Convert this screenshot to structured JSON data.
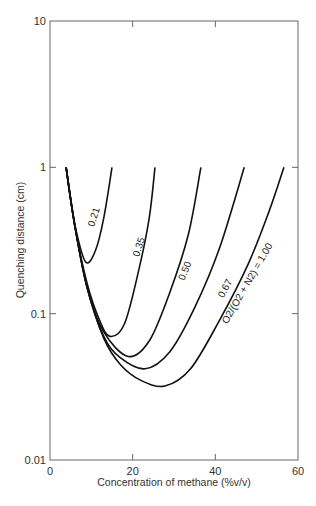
{
  "chart_data": {
    "type": "line",
    "title": "",
    "xlabel": "Concentration of methane (%v/v)",
    "ylabel": "Quenching distance (cm)",
    "xlim": [
      0,
      60
    ],
    "ylim": [
      0.01,
      10
    ],
    "yscale": "log",
    "grid": false,
    "x_ticks": [
      "0",
      "20",
      "40",
      "60"
    ],
    "y_ticks": [
      "0.01",
      "0.1",
      "1",
      "10"
    ],
    "legend": "inline curve labels",
    "series": [
      {
        "name": "0.21",
        "label": "0.21",
        "points": [
          [
            3.9,
            1.0
          ],
          [
            5.0,
            0.6
          ],
          [
            6.5,
            0.35
          ],
          [
            8.7,
            0.224
          ],
          [
            11,
            0.27
          ],
          [
            13,
            0.45
          ],
          [
            15,
            1.0
          ]
        ]
      },
      {
        "name": "0.35",
        "label": "0.35",
        "points": [
          [
            3.9,
            1.0
          ],
          [
            6,
            0.4
          ],
          [
            9,
            0.16
          ],
          [
            12,
            0.09
          ],
          [
            14.5,
            0.07
          ],
          [
            18,
            0.085
          ],
          [
            21.5,
            0.2
          ],
          [
            24,
            0.45
          ],
          [
            25.4,
            1.0
          ]
        ]
      },
      {
        "name": "0.50",
        "label": "0.50",
        "points": [
          [
            3.9,
            1.0
          ],
          [
            6,
            0.4
          ],
          [
            9,
            0.15
          ],
          [
            13,
            0.075
          ],
          [
            18.9,
            0.051
          ],
          [
            24,
            0.065
          ],
          [
            29,
            0.14
          ],
          [
            33.5,
            0.35
          ],
          [
            36.5,
            1.0
          ]
        ]
      },
      {
        "name": "0.67",
        "label": "0.67",
        "points": [
          [
            3.9,
            1.0
          ],
          [
            6,
            0.4
          ],
          [
            9,
            0.15
          ],
          [
            13,
            0.07
          ],
          [
            17,
            0.05
          ],
          [
            23,
            0.042
          ],
          [
            29,
            0.055
          ],
          [
            35,
            0.11
          ],
          [
            41,
            0.28
          ],
          [
            47,
            1.0
          ]
        ]
      },
      {
        "name": "1.00",
        "label": "O2/(O2 + N2) = 1.00",
        "points": [
          [
            3.9,
            1.0
          ],
          [
            6,
            0.4
          ],
          [
            9,
            0.15
          ],
          [
            13,
            0.068
          ],
          [
            17,
            0.045
          ],
          [
            22,
            0.035
          ],
          [
            27.8,
            0.032
          ],
          [
            34,
            0.042
          ],
          [
            41,
            0.09
          ],
          [
            48,
            0.22
          ],
          [
            53,
            0.5
          ],
          [
            56.6,
            1.0
          ]
        ]
      }
    ]
  }
}
